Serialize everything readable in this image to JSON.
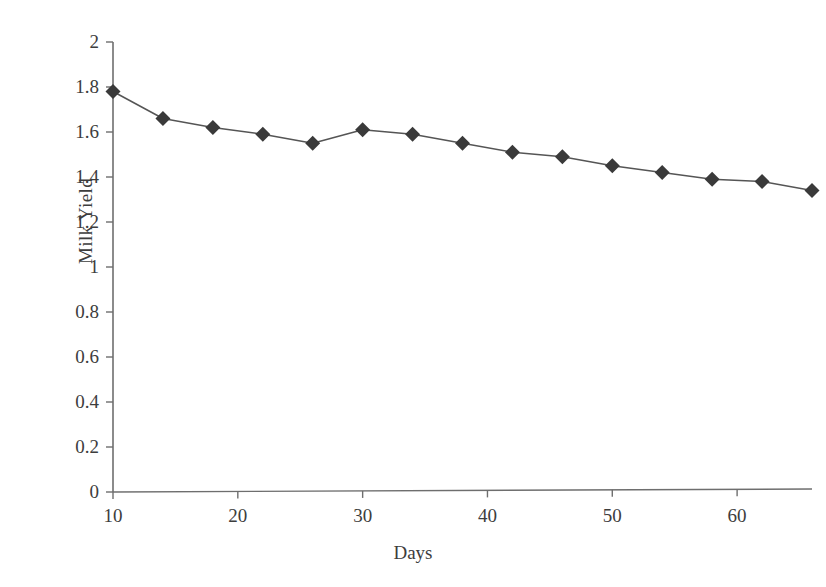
{
  "chart_data": {
    "type": "line",
    "title": "",
    "xlabel": "Days",
    "ylabel": "Milk Yield",
    "xlim": [
      10,
      66
    ],
    "ylim": [
      0,
      2
    ],
    "grid": false,
    "legend": null,
    "marker": "diamond",
    "marker_color": "#3a3a3a",
    "line_color": "#555555",
    "x": [
      10,
      14,
      18,
      22,
      26,
      30,
      34,
      38,
      42,
      46,
      50,
      54,
      58,
      62,
      66
    ],
    "values": [
      1.78,
      1.66,
      1.62,
      1.59,
      1.55,
      1.61,
      1.59,
      1.55,
      1.51,
      1.49,
      1.45,
      1.42,
      1.39,
      1.38,
      1.34
    ],
    "series": [
      {
        "name": "Milk Yield",
        "values": [
          1.78,
          1.66,
          1.62,
          1.59,
          1.55,
          1.61,
          1.59,
          1.55,
          1.51,
          1.49,
          1.45,
          1.42,
          1.39,
          1.38,
          1.34
        ]
      }
    ],
    "x_tick_labels": [
      "10",
      "20",
      "30",
      "40",
      "50",
      "60"
    ],
    "x_tick_values": [
      10,
      20,
      30,
      40,
      50,
      60
    ],
    "y_tick_labels": [
      "0",
      "0.2",
      "0.4",
      "0.6",
      "0.8",
      "1",
      "1.2",
      "1.4",
      "1.6",
      "1.8",
      "2"
    ],
    "y_tick_values": [
      0,
      0.2,
      0.4,
      0.6,
      0.8,
      1,
      1.2,
      1.4,
      1.6,
      1.8,
      2
    ]
  },
  "axis_titles": {
    "x": "Days",
    "y": "Milk Yield"
  },
  "colors": {
    "background": "#ffffff",
    "axis": "#6e6e6e",
    "line": "#555555",
    "marker": "#3a3a3a",
    "text": "#3d3d3d"
  }
}
